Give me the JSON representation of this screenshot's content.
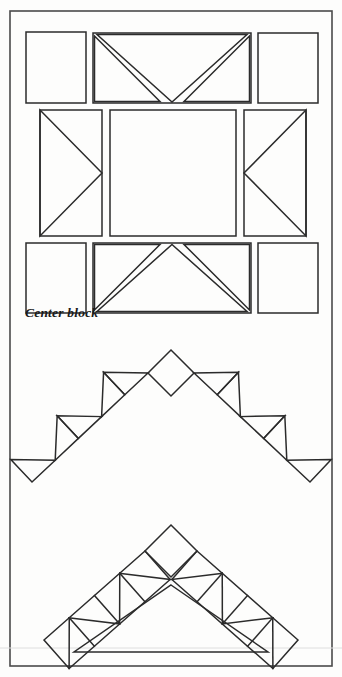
{
  "page": {
    "background_color": "#fdfdfc",
    "ink_color": "#2b2b2b",
    "width": 342,
    "height": 677
  },
  "frame": {
    "name": "page-border",
    "x": 10,
    "y": 11,
    "width": 322,
    "height": 655,
    "stroke_color": "#4a4a4a",
    "stroke_width": 1.6
  },
  "scan_line": {
    "name": "scan-artifact-line",
    "y": 648,
    "color": "#dedede"
  },
  "captions": {
    "center_block": "Center block"
  },
  "center_block": {
    "name": "center-block-diagram",
    "description": "Nine patch center block with plain corner squares, flying geese top and bottom, and half square triangle side rectangles",
    "bounds": {
      "x": 26,
      "y": 32,
      "width": 292,
      "height": 265
    },
    "cells": [
      {
        "id": "corner-top-left",
        "type": "plain-square",
        "x": 26,
        "y": 32,
        "w": 60,
        "h": 71
      },
      {
        "id": "top-center-geese",
        "type": "flying-geese-down",
        "x": 93,
        "y": 33,
        "w": 158,
        "h": 70
      },
      {
        "id": "corner-top-right",
        "type": "plain-square",
        "x": 258,
        "y": 33,
        "w": 60,
        "h": 70
      },
      {
        "id": "left-side-triangle",
        "type": "half-square-right",
        "x": 40,
        "y": 110,
        "w": 62,
        "h": 126
      },
      {
        "id": "center-square",
        "type": "plain-square",
        "x": 110,
        "y": 110,
        "w": 126,
        "h": 126
      },
      {
        "id": "right-side-triangle",
        "type": "half-square-left",
        "x": 244,
        "y": 110,
        "w": 62,
        "h": 126
      },
      {
        "id": "corner-bottom-left",
        "type": "plain-square",
        "x": 26,
        "y": 243,
        "w": 60,
        "h": 70
      },
      {
        "id": "bottom-center-geese",
        "type": "flying-geese-up",
        "x": 93,
        "y": 243,
        "w": 158,
        "h": 70
      },
      {
        "id": "corner-bottom-right",
        "type": "plain-square",
        "x": 258,
        "y": 243,
        "w": 60,
        "h": 70
      }
    ]
  },
  "chevron_open": {
    "name": "sawtooth-chevron-open",
    "description": "Open chevron border unit made of separated alternating triangles with a diamond square at the apex",
    "apex": {
      "x": 171,
      "y": 350
    },
    "left_end": {
      "x": 32,
      "y": 482
    },
    "right_end": {
      "x": 310,
      "y": 482
    },
    "units_per_arm": 5,
    "apex_shape": "diamond"
  },
  "chevron_solid": {
    "name": "sawtooth-chevron-solid",
    "description": "Closed chevron border unit, a continuous sawtooth band with joined triangles and a diamond square at the apex",
    "apex": {
      "x": 171,
      "y": 525
    },
    "left_end": {
      "x": 44,
      "y": 640
    },
    "right_end": {
      "x": 298,
      "y": 640
    },
    "units_per_arm": 4,
    "apex_shape": "diamond"
  }
}
